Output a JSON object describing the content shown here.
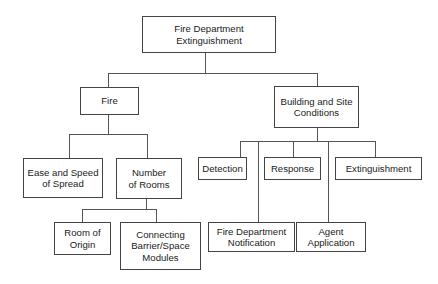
{
  "diagram": {
    "type": "tree",
    "root": {
      "label": "Fire Department\nExtinguishment",
      "children": [
        {
          "label": "Fire",
          "children": [
            {
              "label": "Ease and Speed\nof Spread"
            },
            {
              "label": "Number\nof Rooms",
              "children": [
                {
                  "label": "Room of\nOrigin"
                },
                {
                  "label": "Connecting\nBarrier/Space\nModules"
                }
              ]
            }
          ]
        },
        {
          "label": "Building and Site\nConditions",
          "children": [
            {
              "label": "Detection"
            },
            {
              "label": "Fire Department\nNotification"
            },
            {
              "label": "Response"
            },
            {
              "label": "Agent\nApplication"
            },
            {
              "label": "Extinguishment"
            }
          ]
        }
      ]
    }
  },
  "nodes": {
    "root": "Fire Department\nExtinguishment",
    "fire": "Fire",
    "building": "Building and Site\nConditions",
    "ease": "Ease and Speed\nof Spread",
    "rooms": "Number\nof Rooms",
    "origin": "Room of\nOrigin",
    "connecting": "Connecting\nBarrier/Space\nModules",
    "detection": "Detection",
    "notification": "Fire Department\nNotification",
    "response": "Response",
    "agent": "Agent\nApplication",
    "extinguishment": "Extinguishment"
  }
}
